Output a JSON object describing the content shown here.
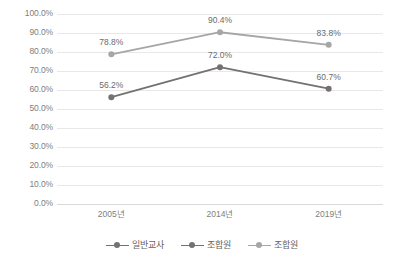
{
  "chart_data": {
    "type": "line",
    "title": "",
    "xlabel": "",
    "ylabel": "",
    "categories": [
      "2005년",
      "2014년",
      "2019년"
    ],
    "ylim": [
      0,
      100
    ],
    "yticks": [
      "0.0%",
      "10.0%",
      "20.0%",
      "30.0%",
      "40.0%",
      "50.0%",
      "60.0%",
      "70.0%",
      "80.0%",
      "90.0%",
      "100.0%"
    ],
    "ytick_values": [
      0,
      10,
      20,
      30,
      40,
      50,
      60,
      70,
      80,
      90,
      100
    ],
    "grid": "horizontal",
    "legend_position": "bottom",
    "series": [
      {
        "name": "일반교사",
        "color": "#767171",
        "values": [
          56.2,
          72.0,
          60.7
        ],
        "labels": [
          "56.2%",
          "72.0%",
          "60.7%"
        ]
      },
      {
        "name": "조합원",
        "color": "#a6a6a6",
        "values": [
          78.8,
          90.4,
          83.8
        ],
        "labels": [
          "78.8%",
          "90.4%",
          "83.8%"
        ]
      }
    ],
    "legend_entries": [
      {
        "label": "일반교사",
        "color": "#767171"
      },
      {
        "label": "조합원",
        "color": "#767171"
      },
      {
        "label": "조합원",
        "color": "#a6a6a6"
      }
    ]
  },
  "colors": {
    "background": "#ffffff",
    "gridline": "#e8e8e8",
    "axis": "#d9d9d9",
    "tick_text": "#808080",
    "label_text": "#6b6b6b",
    "series_dark": "#767171",
    "series_light": "#a6a6a6"
  }
}
